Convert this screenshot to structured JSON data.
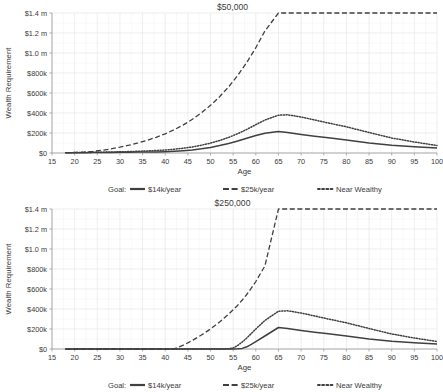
{
  "figure": {
    "background": "#ffffff",
    "gridline_color": "#e6e6e6",
    "minor_gridline_color": "#f0f0f0",
    "axis_color": "#9a9a9a",
    "series_color": "#404040"
  },
  "legend": {
    "title": "Goal:",
    "entries": [
      {
        "label": "$14k/year",
        "style": "solid",
        "key": "goal14k"
      },
      {
        "label": "$25k/year",
        "style": "dashed",
        "key": "goal25k"
      },
      {
        "label": "Near Wealthy",
        "style": "dotted",
        "key": "nearwealthy"
      }
    ]
  },
  "chart_data": [
    {
      "type": "line",
      "title": "$50,000",
      "xlabel": "Age",
      "ylabel": "Wealth Requirement",
      "xlim": [
        15,
        100
      ],
      "ylim": [
        0,
        1400000
      ],
      "xticks": [
        15,
        20,
        25,
        30,
        35,
        40,
        45,
        50,
        55,
        60,
        65,
        70,
        75,
        80,
        85,
        90,
        95,
        100
      ],
      "xticklabels": [
        "15",
        "20",
        "25",
        "30",
        "35",
        "40",
        "45",
        "50",
        "55",
        "60",
        "65",
        "70",
        "75",
        "80",
        "85",
        "90",
        "95",
        "100"
      ],
      "yticks": [
        0,
        200000,
        400000,
        600000,
        800000,
        1000000,
        1200000,
        1400000
      ],
      "yticklabels": [
        "$0",
        "$200k",
        "$400k",
        "$600k",
        "$800k",
        "$1.0 m",
        "$1.2 m",
        "$1.4 m"
      ],
      "grid": true,
      "legend_position": "bottom",
      "x": [
        18,
        20,
        22,
        24,
        26,
        28,
        30,
        32,
        34,
        36,
        38,
        40,
        42,
        44,
        46,
        48,
        50,
        52,
        54,
        56,
        58,
        60,
        62,
        65,
        67,
        70,
        73,
        76,
        80,
        85,
        90,
        95,
        100
      ],
      "series": [
        {
          "name": "$14k/year",
          "style": "solid",
          "values": [
            2000,
            2500,
            3000,
            4000,
            5000,
            6000,
            7000,
            8000,
            9000,
            10000,
            11000,
            13000,
            17000,
            23000,
            31000,
            42000,
            56000,
            74000,
            95000,
            120000,
            148000,
            175000,
            198000,
            215000,
            205000,
            185000,
            168000,
            152000,
            130000,
            100000,
            78000,
            62000,
            50000
          ]
        },
        {
          "name": "$25k/year",
          "style": "dashed",
          "values": [
            3000,
            5000,
            9000,
            16000,
            27000,
            41000,
            58000,
            78000,
            101000,
            127000,
            157000,
            192000,
            233000,
            281000,
            337000,
            402000,
            477000,
            563000,
            662000,
            776000,
            906000,
            1053000,
            1220000,
            1400000,
            1400000,
            1400000,
            1400000,
            1400000,
            1400000,
            1400000,
            1400000,
            1400000,
            1400000
          ]
        },
        {
          "name": "Near Wealthy",
          "style": "dotted",
          "values": [
            3000,
            4000,
            5000,
            6500,
            8000,
            10000,
            12000,
            14500,
            17500,
            21000,
            25000,
            30000,
            38000,
            48000,
            61000,
            78000,
            99000,
            125000,
            156000,
            193000,
            236000,
            283000,
            330000,
            378000,
            382000,
            360000,
            330000,
            300000,
            262000,
            205000,
            150000,
            110000,
            75000
          ]
        }
      ]
    },
    {
      "type": "line",
      "title": "$250,000",
      "xlabel": "Age",
      "ylabel": "Wealth Requirement",
      "xlim": [
        15,
        100
      ],
      "ylim": [
        0,
        1400000
      ],
      "xticks": [
        15,
        20,
        25,
        30,
        35,
        40,
        45,
        50,
        55,
        60,
        65,
        70,
        75,
        80,
        85,
        90,
        95,
        100
      ],
      "xticklabels": [
        "15",
        "20",
        "25",
        "30",
        "35",
        "40",
        "45",
        "50",
        "55",
        "60",
        "65",
        "70",
        "75",
        "80",
        "85",
        "90",
        "95",
        "100"
      ],
      "yticks": [
        0,
        200000,
        400000,
        600000,
        800000,
        1000000,
        1200000,
        1400000
      ],
      "yticklabels": [
        "$0",
        "$200k",
        "$400k",
        "$600k",
        "$800k",
        "$1.0 m",
        "$1.2 m",
        "$1.4 m"
      ],
      "grid": true,
      "legend_position": "bottom",
      "x": [
        18,
        25,
        30,
        35,
        40,
        42,
        44,
        46,
        48,
        50,
        52,
        54,
        55,
        56,
        57,
        58,
        59,
        60,
        62,
        65,
        67,
        70,
        73,
        76,
        80,
        85,
        90,
        95,
        100
      ],
      "series": [
        {
          "name": "$14k/year",
          "style": "solid",
          "values": [
            0,
            0,
            0,
            0,
            0,
            0,
            0,
            0,
            0,
            0,
            0,
            0,
            0,
            2000,
            6000,
            22000,
            46000,
            74000,
            130000,
            215000,
            205000,
            185000,
            168000,
            152000,
            130000,
            100000,
            78000,
            62000,
            50000
          ]
        },
        {
          "name": "$25k/year",
          "style": "dashed",
          "values": [
            0,
            0,
            0,
            0,
            0,
            2000,
            38000,
            86000,
            140000,
            200000,
            270000,
            348000,
            392000,
            438000,
            490000,
            545000,
            608000,
            675000,
            830000,
            1400000,
            1400000,
            1400000,
            1400000,
            1400000,
            1400000,
            1400000,
            1400000,
            1400000,
            1400000
          ]
        },
        {
          "name": "Near Wealthy",
          "style": "dotted",
          "values": [
            0,
            0,
            0,
            0,
            0,
            0,
            0,
            0,
            0,
            0,
            0,
            2000,
            10000,
            36000,
            70000,
            110000,
            155000,
            200000,
            285000,
            378000,
            382000,
            360000,
            330000,
            300000,
            262000,
            205000,
            150000,
            110000,
            75000
          ]
        }
      ]
    }
  ]
}
